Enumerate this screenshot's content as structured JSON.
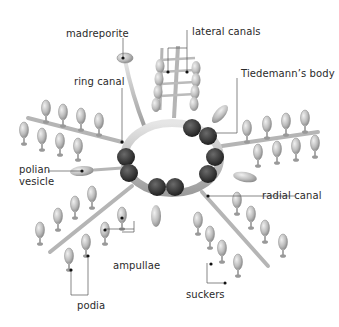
{
  "diagram": {
    "labels": {
      "madreporite": "madreporite",
      "lateral_canals": "lateral canals",
      "ring_canal": "ring canal",
      "tiedemanns_body": "Tiedemann’s body",
      "polian_vesicle_line1": "polian",
      "polian_vesicle_line2": "vesicle",
      "radial_canal": "radial canal",
      "ampullae": "ampullae",
      "podia": "podia",
      "suckers": "suckers"
    },
    "colors": {
      "canal": "#c9c9c9",
      "canal_shade": "#9a9a9a",
      "tiedemann": "#3a3a3a",
      "leader_line": "#555555",
      "dot": "#111111",
      "text": "#2a2a2a"
    }
  }
}
